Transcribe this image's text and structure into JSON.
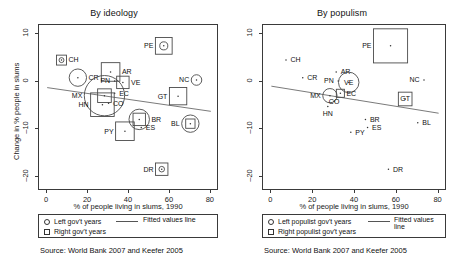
{
  "figure": {
    "width": 456,
    "height": 269,
    "background": "#ffffff",
    "ink": "#1a1a1a"
  },
  "chart_data": [
    {
      "type": "scatter",
      "title": "By ideology",
      "xlabel": "% of people living in slums, 1990",
      "ylabel": "Change in % people in slums",
      "xlim": [
        -4,
        84
      ],
      "ylim": [
        -23,
        12
      ],
      "xticks": [
        0,
        20,
        40,
        60,
        80
      ],
      "yticks": [
        10,
        0,
        -10,
        -20
      ],
      "grid": false,
      "legend_position": "below-plot",
      "legend": [
        {
          "symbol": "circle",
          "label": "Left gov't years"
        },
        {
          "symbol": "square",
          "label": "Right gov't years"
        },
        {
          "symbol": "line",
          "label": "Fitted values line"
        }
      ],
      "fit_line": {
        "x0": 0,
        "y0": -1.2,
        "x1": 80,
        "y1": -6.2
      },
      "points": [
        {
          "code": "CH",
          "x": 7,
          "y": 4.6,
          "left": 1.6,
          "right": 3.2,
          "label_pos": "right"
        },
        {
          "code": "CR",
          "x": 15,
          "y": 0.9,
          "left": 5.6,
          "right": 0.0,
          "label_pos": "right"
        },
        {
          "code": "PE",
          "x": 57,
          "y": 7.6,
          "left": 2.6,
          "right": 5.4,
          "label_pos": "left"
        },
        {
          "code": "AR",
          "x": 31,
          "y": 2.1,
          "left": 0.0,
          "right": 6.0,
          "label_pos": "right"
        },
        {
          "code": "PN",
          "x": 33,
          "y": 0.2,
          "left": 0.0,
          "right": 0.0,
          "label_pos": "left"
        },
        {
          "code": "VE",
          "x": 37,
          "y": -0.1,
          "left": 0.0,
          "right": 4.0,
          "label_pos": "right"
        },
        {
          "code": "EC",
          "x": 33,
          "y": -2.4,
          "left": 0.0,
          "right": 0.0,
          "label_pos": "right"
        },
        {
          "code": "MX",
          "x": 28,
          "y": -2.9,
          "left": 13.0,
          "right": 4.4,
          "label_pos": "left"
        },
        {
          "code": "CO",
          "x": 30,
          "y": -4.5,
          "left": 0.0,
          "right": 0.0,
          "label_pos": "right"
        },
        {
          "code": "HN",
          "x": 27,
          "y": -4.8,
          "left": 0.0,
          "right": 7.6,
          "label_pos": "left"
        },
        {
          "code": "NC",
          "x": 73,
          "y": 0.4,
          "left": 3.4,
          "right": 0.0,
          "label_pos": "left"
        },
        {
          "code": "GT",
          "x": 64,
          "y": -3.0,
          "left": 0.0,
          "right": 5.6,
          "label_pos": "left"
        },
        {
          "code": "BR",
          "x": 45,
          "y": -7.9,
          "left": 6.6,
          "right": 4.0,
          "label_pos": "right"
        },
        {
          "code": "ES",
          "x": 46,
          "y": -9.6,
          "left": 0.0,
          "right": 0.0,
          "label_pos": "right"
        },
        {
          "code": "BL",
          "x": 70,
          "y": -8.8,
          "left": 5.6,
          "right": 3.0,
          "label_pos": "left"
        },
        {
          "code": "PY",
          "x": 38,
          "y": -10.4,
          "left": 0.0,
          "right": 6.0,
          "label_pos": "left"
        },
        {
          "code": "DR",
          "x": 56,
          "y": -18.4,
          "left": 1.8,
          "right": 4.0,
          "label_pos": "left"
        }
      ],
      "source": "Source: World Bank 2007 and Keefer 2005"
    },
    {
      "type": "scatter",
      "title": "By populism",
      "xlabel": "% of people living in slums, 1990",
      "ylabel": "",
      "xlim": [
        -4,
        84
      ],
      "ylim": [
        -23,
        12
      ],
      "xticks": [
        0,
        20,
        40,
        60,
        80
      ],
      "yticks": [
        10,
        0,
        -10,
        -20
      ],
      "grid": false,
      "legend_position": "below-plot",
      "legend": [
        {
          "symbol": "circle",
          "label": "Left populist gov't years"
        },
        {
          "symbol": "square",
          "label": "Right populist gov't years"
        },
        {
          "symbol": "line",
          "label": "Fitted values line"
        }
      ],
      "fit_line": {
        "x0": 0,
        "y0": -0.9,
        "x1": 80,
        "y1": -6.6
      },
      "points": [
        {
          "code": "CH",
          "x": 7,
          "y": 4.6,
          "left": 0.0,
          "right": 0.0,
          "label_pos": "right"
        },
        {
          "code": "CR",
          "x": 15,
          "y": 0.9,
          "left": 0.0,
          "right": 0.0,
          "label_pos": "right"
        },
        {
          "code": "PE",
          "x": 57,
          "y": 7.6,
          "left": 0.0,
          "right": 11.0,
          "label_pos": "left"
        },
        {
          "code": "AR",
          "x": 31,
          "y": 2.1,
          "left": 0.0,
          "right": 0.0,
          "label_pos": "right"
        },
        {
          "code": "PN",
          "x": 32,
          "y": 0.2,
          "left": 0.0,
          "right": 0.0,
          "label_pos": "left"
        },
        {
          "code": "VE",
          "x": 37,
          "y": -0.1,
          "left": 6.6,
          "right": 0.0,
          "label_pos": "center"
        },
        {
          "code": "EC",
          "x": 33,
          "y": -2.4,
          "left": 0.0,
          "right": 2.6,
          "label_pos": "right"
        },
        {
          "code": "MX",
          "x": 28,
          "y": -2.9,
          "left": 4.6,
          "right": 0.0,
          "label_pos": "left"
        },
        {
          "code": "CO",
          "x": 30,
          "y": -4.1,
          "left": 0.0,
          "right": 0.0,
          "label_pos": "center"
        },
        {
          "code": "HN",
          "x": 27,
          "y": -5.2,
          "left": 0.0,
          "right": 0.0,
          "label_pos": "below"
        },
        {
          "code": "NC",
          "x": 73,
          "y": 0.4,
          "left": 0.0,
          "right": 0.0,
          "label_pos": "left"
        },
        {
          "code": "GT",
          "x": 64,
          "y": -3.6,
          "left": 0.0,
          "right": 4.4,
          "label_pos": "center"
        },
        {
          "code": "BR",
          "x": 45,
          "y": -7.9,
          "left": 0.0,
          "right": 0.0,
          "label_pos": "right"
        },
        {
          "code": "ES",
          "x": 46,
          "y": -9.6,
          "left": 0.0,
          "right": 0.0,
          "label_pos": "right"
        },
        {
          "code": "BL",
          "x": 70,
          "y": -8.6,
          "left": 0.0,
          "right": 0.0,
          "label_pos": "right"
        },
        {
          "code": "PY",
          "x": 38,
          "y": -10.6,
          "left": 0.0,
          "right": 0.0,
          "label_pos": "right"
        },
        {
          "code": "DR",
          "x": 56,
          "y": -18.4,
          "left": 0.0,
          "right": 0.0,
          "label_pos": "right"
        }
      ],
      "source": "Source: World Bank 2007 and Keefer 2005"
    }
  ],
  "panels": {
    "left": {
      "title": "By ideology",
      "xlabel": "% of people living in slums, 1990",
      "ylabel": "Change in % people in slums",
      "xticks": [
        "0",
        "20",
        "40",
        "60",
        "80"
      ],
      "yticks": [
        "10",
        "0",
        "-10",
        "-20"
      ],
      "legend": {
        "left_label": "Left gov't years",
        "right_label": "Right gov't years",
        "fit_label": "Fitted values line"
      },
      "source": "Source: World Bank 2007 and Keefer 2005"
    },
    "right": {
      "title": "By populism",
      "xlabel": "% of people living in slums, 1990",
      "ylabel": "",
      "xticks": [
        "0",
        "20",
        "40",
        "60",
        "80"
      ],
      "yticks": [
        "10",
        "0",
        "-10",
        "-20"
      ],
      "legend": {
        "left_label": "Left populist gov't years",
        "right_label": "Right populist gov't years",
        "fit_label": "Fitted values line"
      },
      "source": "Source: World Bank 2007 and Keefer 2005"
    }
  }
}
